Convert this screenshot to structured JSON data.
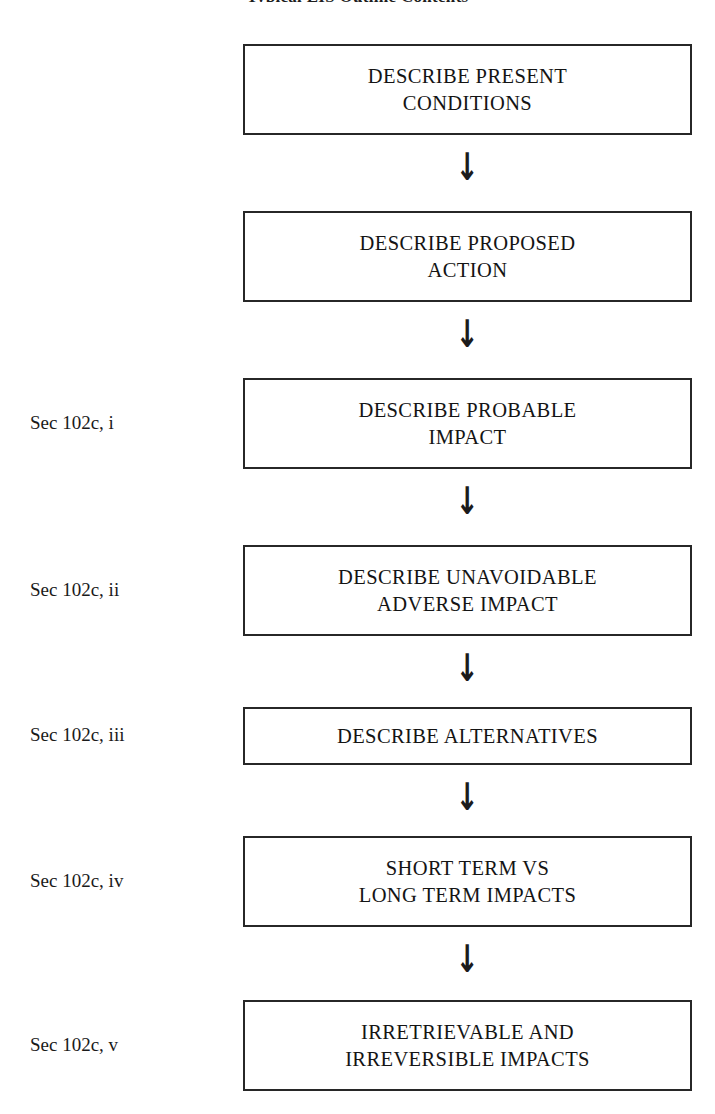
{
  "chart": {
    "title": "Typical EIS Outline Contents",
    "arrow_glyph": "↓",
    "arrow_name": "down-arrow-icon",
    "box_border_color": "#272727",
    "background_color": "#ffffff",
    "text_color": "#141414",
    "steps": [
      {
        "label": "",
        "text": "DESCRIBE PRESENT\nCONDITIONS",
        "box_top": 44,
        "box_height": 91,
        "arrow_top": 150
      },
      {
        "label": "",
        "text": "DESCRIBE PROPOSED\nACTION",
        "box_top": 211,
        "box_height": 91,
        "arrow_top": 317
      },
      {
        "label": "Sec 102c, i",
        "text": "DESCRIBE PROBABLE\nIMPACT",
        "box_top": 378,
        "box_height": 91,
        "arrow_top": 484
      },
      {
        "label": "Sec 102c, ii",
        "text": "DESCRIBE UNAVOIDABLE\nADVERSE IMPACT",
        "box_top": 545,
        "box_height": 91,
        "arrow_top": 651
      },
      {
        "label": "Sec 102c, iii",
        "text": "DESCRIBE ALTERNATIVES",
        "box_top": 707,
        "box_height": 58,
        "arrow_top": 780
      },
      {
        "label": "Sec 102c, iv",
        "text": "SHORT TERM VS\nLONG TERM IMPACTS",
        "box_top": 836,
        "box_height": 91,
        "arrow_top": 942
      },
      {
        "label": "Sec 102c, v",
        "text": "IRRETRIEVABLE AND\nIRREVERSIBLE IMPACTS",
        "box_top": 1000,
        "box_height": 91,
        "arrow_top": null
      }
    ]
  }
}
